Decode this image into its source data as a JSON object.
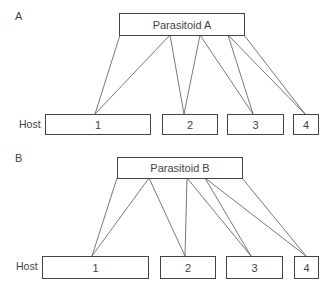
{
  "panels": [
    {
      "label": "A",
      "parasitoid": "Parasitoid A",
      "host_label": "Host",
      "hosts": [
        "1",
        "2",
        "3",
        "4"
      ]
    },
    {
      "label": "B",
      "parasitoid": "Parasitoid B",
      "host_label": "Host",
      "hosts": [
        "1",
        "2",
        "3",
        "4"
      ]
    }
  ]
}
